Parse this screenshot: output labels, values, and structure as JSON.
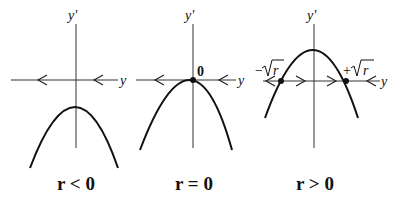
{
  "panels": [
    {
      "id": "r-negative",
      "condition_label": "r < 0",
      "vertical_axis_label": "y'",
      "horizontal_axis_label": "y",
      "fixed_points": [],
      "flow_arrows": [
        "left",
        "left"
      ]
    },
    {
      "id": "r-zero",
      "condition_label": "r = 0",
      "vertical_axis_label": "y'",
      "horizontal_axis_label": "y",
      "fixed_points": [
        {
          "label": "0"
        }
      ],
      "flow_arrows": [
        "left",
        "left"
      ]
    },
    {
      "id": "r-positive",
      "condition_label": "r > 0",
      "vertical_axis_label": "y'",
      "horizontal_axis_label": "y",
      "fixed_points": [
        {
          "label": "−√r"
        },
        {
          "label": "+√r"
        }
      ],
      "flow_arrows": [
        "left",
        "right",
        "right",
        "left"
      ]
    }
  ],
  "labels": {
    "p1_cond": "r < 0",
    "p2_cond": "r = 0",
    "p3_cond": "r > 0",
    "yprime": "y'",
    "y": "y",
    "zero": "0",
    "neg_sqrt_sign": "−",
    "pos_sqrt_sign": "+",
    "sqrt_r": "r"
  }
}
